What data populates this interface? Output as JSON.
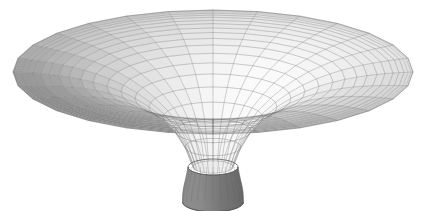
{
  "figure": {
    "title": "",
    "background_color": "#ffffff",
    "width": 423,
    "height": 211,
    "render_style": "shaded-wireframe-mesh",
    "object_name": "funnel-surface-of-revolution"
  },
  "chart_data": {
    "type": "surface",
    "title": "",
    "subtitle": "",
    "xlabel": "",
    "ylabel": "",
    "zlabel": "",
    "axes_visible": false,
    "tick_labels_visible": false,
    "legend": null,
    "legend_position": "none",
    "grid": true,
    "annotations": [],
    "surface_kind": "funnel / gravity-well (Flamm paraboloid)",
    "parametric_form": "z = -c / sqrt(r)  for r in [r_throat, r_rim], revolved about the z axis",
    "mesh": {
      "radial_spokes": 28,
      "concentric_rings": 20,
      "line_color": "#6f6f6f",
      "line_width": 0.45
    },
    "projection": {
      "type": "oblique-orthographic",
      "elevation_deg": 18,
      "azimuth_deg": 0,
      "y_compression": 0.3
    },
    "radial_profile": {
      "r_values": [
        0.1,
        0.14,
        0.19,
        0.25,
        0.32,
        0.39,
        0.46,
        0.53,
        0.6,
        0.66,
        0.72,
        0.77,
        0.82,
        0.86,
        0.9,
        0.93,
        0.955,
        0.975,
        0.99,
        1.0
      ],
      "z_values": [
        -1.0,
        -0.79,
        -0.62,
        -0.48,
        -0.366,
        -0.275,
        -0.204,
        -0.149,
        -0.107,
        -0.077,
        -0.054,
        -0.038,
        -0.026,
        -0.017,
        -0.011,
        -0.007,
        -0.004,
        -0.002,
        -0.0005,
        0.0
      ]
    },
    "throat": {
      "radius_fraction": 0.115,
      "depth_fraction": 1.0,
      "fill_color_light": "#8d8d8d",
      "fill_color_dark": "#686868"
    },
    "shading": {
      "light_azimuth_deg": 135,
      "light_elevation_deg": 55,
      "highlight_color": "#fbfbfb",
      "midtone_color": "#c9c9c9",
      "shadow_color": "#8f8f8f",
      "deep_shadow_color": "#6e6e6e"
    },
    "geometry_px": {
      "center_x": 213,
      "rim_center_y": 72,
      "rim_radius_x": 200,
      "rim_radius_y": 62,
      "throat_center_y": 167,
      "throat_radius_x": 25,
      "throat_radius_y": 8,
      "throat_bottom_y": 202,
      "rim_thickness_px": 3
    }
  }
}
